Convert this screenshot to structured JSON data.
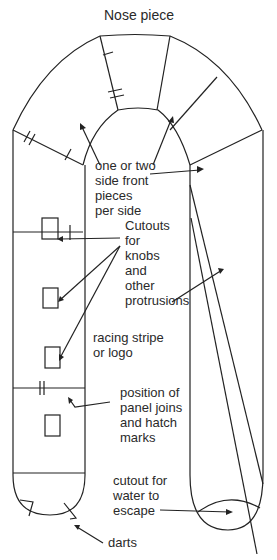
{
  "title": "Nose piece",
  "labels": {
    "side_front": "one or two\nside front\npieces\nper side",
    "cutouts": "Cutouts\nfor\nknobs\nand\nother\nprotrusions",
    "racing_stripe": "racing stripe\nor logo",
    "panel_joins": "position of\npanel joins\nand hatch\nmarks",
    "water_cutout": "cutout for\nwater to\nescape",
    "darts": "darts"
  },
  "colors": {
    "line": "#222222",
    "background": "#ffffff"
  }
}
